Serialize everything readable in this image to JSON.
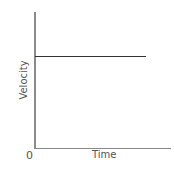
{
  "chart_data": {
    "type": "line",
    "title": "",
    "xlabel": "Time",
    "ylabel": "Velocity",
    "origin_label": "0",
    "x_ticks": [],
    "y_ticks": [],
    "grid": false,
    "legend": null,
    "series": [
      {
        "name": "velocity",
        "description": "constant velocity (horizontal line)",
        "x": [
          0,
          1
        ],
        "y": [
          0.7,
          0.7
        ],
        "color": "#333333"
      }
    ],
    "xlim": [
      0,
      1.25
    ],
    "ylim": [
      0,
      1
    ],
    "axis_color": "#8a8a8a"
  }
}
